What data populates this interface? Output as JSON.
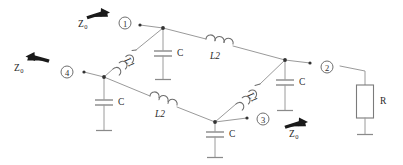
{
  "diagram": {
    "colors": {
      "wire": "#9a9a9a",
      "component": "#7b7b7b",
      "text": "#2a2a2a",
      "arrow": "#1a1a1a",
      "node_dot": "#333333",
      "background": "#ffffff"
    },
    "ports": [
      {
        "id": "port-1",
        "label": "1",
        "x": 125,
        "y": 26
      },
      {
        "id": "port-2",
        "label": "2",
        "x": 330,
        "y": 68
      },
      {
        "id": "port-3",
        "label": "3",
        "x": 270,
        "y": 117
      },
      {
        "id": "port-4",
        "label": "4",
        "x": 67,
        "y": 73
      }
    ],
    "source_labels": [
      {
        "id": "z0-port-1",
        "text": "Z",
        "sub": "0",
        "direction": "right"
      },
      {
        "id": "z0-port-4",
        "text": "Z",
        "sub": "0",
        "direction": "left"
      },
      {
        "id": "z0-port-3",
        "text": "Z",
        "sub": "0",
        "direction": "right"
      }
    ],
    "components": {
      "inductors_l1": [
        {
          "id": "l1-upper-left",
          "label": "L1"
        },
        {
          "id": "l1-lower-right",
          "label": "L1"
        }
      ],
      "inductors_l2": [
        {
          "id": "l2-upper",
          "label": "L2"
        },
        {
          "id": "l2-lower",
          "label": "L2"
        }
      ],
      "capacitors": [
        {
          "id": "c-top-center",
          "label": "C"
        },
        {
          "id": "c-left",
          "label": "C"
        },
        {
          "id": "c-bottom-center",
          "label": "C"
        },
        {
          "id": "c-right",
          "label": "C"
        }
      ],
      "resistors": [
        {
          "id": "r-load",
          "label": "R"
        }
      ]
    }
  }
}
